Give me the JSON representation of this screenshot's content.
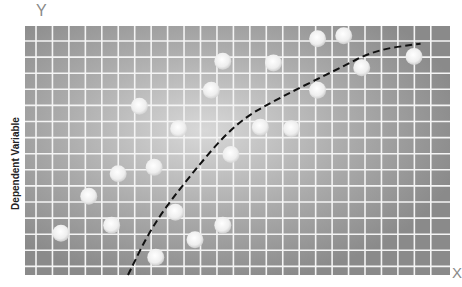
{
  "chart_data": {
    "type": "scatter",
    "title": "",
    "xlabel": "X",
    "ylabel": "Dependent Variable",
    "y_axis_letter": "Y",
    "x_axis_letter": "X",
    "grid": true,
    "legend": null,
    "plot_area_px": {
      "left": 25,
      "top": 26,
      "right": 450,
      "bottom": 275
    },
    "grid_lines": {
      "vertical_count": 25,
      "horizontal_count": 15
    },
    "xlim": [
      0,
      26
    ],
    "ylim": [
      0,
      15.5
    ],
    "series": [
      {
        "name": "observations",
        "marker": "circle",
        "points": [
          {
            "x": 2.2,
            "y": 2.6
          },
          {
            "x": 3.9,
            "y": 4.9
          },
          {
            "x": 5.3,
            "y": 3.1
          },
          {
            "x": 5.7,
            "y": 6.3
          },
          {
            "x": 7.0,
            "y": 10.5
          },
          {
            "x": 7.9,
            "y": 6.7
          },
          {
            "x": 9.2,
            "y": 3.9
          },
          {
            "x": 8.0,
            "y": 1.1
          },
          {
            "x": 9.4,
            "y": 9.1
          },
          {
            "x": 10.4,
            "y": 2.2
          },
          {
            "x": 11.4,
            "y": 11.5
          },
          {
            "x": 12.1,
            "y": 13.3
          },
          {
            "x": 12.1,
            "y": 3.1
          },
          {
            "x": 12.6,
            "y": 7.5
          },
          {
            "x": 14.4,
            "y": 9.2
          },
          {
            "x": 15.2,
            "y": 13.2
          },
          {
            "x": 16.3,
            "y": 9.1
          },
          {
            "x": 17.9,
            "y": 11.5
          },
          {
            "x": 17.9,
            "y": 14.7
          },
          {
            "x": 19.5,
            "y": 14.9
          },
          {
            "x": 20.6,
            "y": 12.9
          },
          {
            "x": 23.8,
            "y": 13.6
          }
        ]
      },
      {
        "name": "trend-curve",
        "style": "dashed",
        "points": [
          {
            "x": 6.3,
            "y": 0.0
          },
          {
            "x": 7.8,
            "y": 3.1
          },
          {
            "x": 10.1,
            "y": 6.2
          },
          {
            "x": 12.9,
            "y": 9.5
          },
          {
            "x": 15.7,
            "y": 11.1
          },
          {
            "x": 19.1,
            "y": 12.8
          },
          {
            "x": 21.4,
            "y": 14.0
          },
          {
            "x": 24.2,
            "y": 14.4
          }
        ]
      }
    ]
  },
  "labels": {
    "y_letter": "Y",
    "x_letter": "X",
    "ylabel": "Dependent Variable",
    "xlabel": ""
  },
  "colors": {
    "plot_bg_dark": "#8c8c8c",
    "plot_bg_light": "#d6d6d6",
    "grid": "#f4f4f4",
    "marker": "#eeeeee",
    "curve": "#111111",
    "axis_letter": "#8a8a8a"
  }
}
